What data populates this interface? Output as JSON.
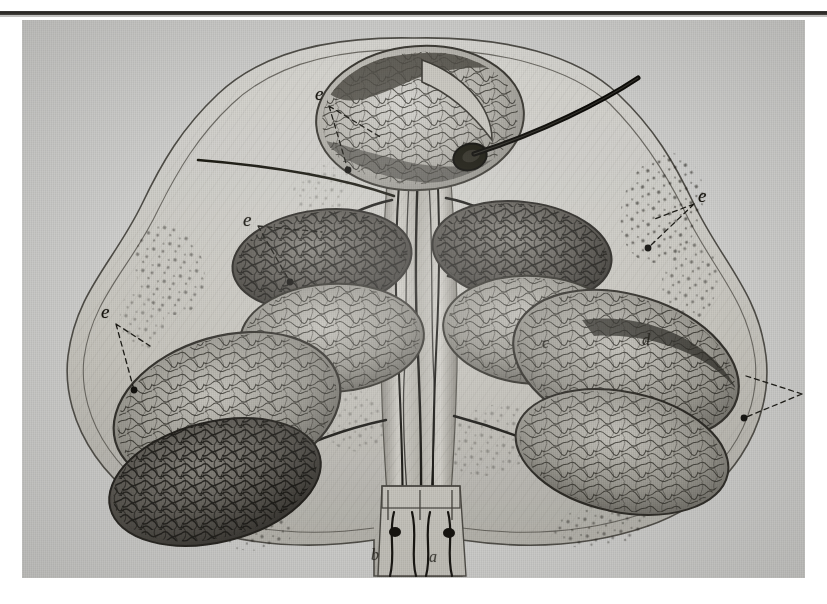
{
  "plate": {
    "title": "Anatomical engraving plate",
    "description": "Cross-section of a lobed glandular organ showing paired symmetric lobules with dense vascular (capillary) networks, a central branching vascular trunk, an outer membranous capsule and a fine probe/bristle inserted into a central aperture.",
    "medium": "steel engraving on laid paper, halftone scan",
    "background_color": "#cfcfcd",
    "ink_color": "#1a1815",
    "rule_color": "#14120f"
  },
  "labels": [
    {
      "id": "label-e-top-left",
      "text": "e",
      "x": 293,
      "y": 74,
      "leader": "dashed"
    },
    {
      "id": "label-e-mid-left",
      "text": "e",
      "x": 221,
      "y": 200,
      "leader": "dashed"
    },
    {
      "id": "label-e-far-left",
      "text": "e",
      "x": 79,
      "y": 292,
      "leader": "dashed"
    },
    {
      "id": "label-e-right",
      "text": "e",
      "x": 676,
      "y": 176,
      "leader": "dashed"
    },
    {
      "id": "label-e-far-right",
      "text": "e",
      "x": 784,
      "y": 366,
      "leader": "dashed"
    },
    {
      "id": "label-d-center-right",
      "text": "d",
      "x": 620,
      "y": 322,
      "leader": "none"
    },
    {
      "id": "label-c-center-right",
      "text": "c",
      "x": 520,
      "y": 325,
      "leader": "none"
    },
    {
      "id": "label-b-bottom-left",
      "text": "b",
      "x": 372,
      "y": 560,
      "leader": "none"
    },
    {
      "id": "label-a-bottom-right",
      "text": "a",
      "x": 430,
      "y": 562,
      "leader": "none"
    }
  ],
  "features": {
    "lobule_count": 8,
    "central_trunk": "central vascular trunk",
    "probe": "inserted bristle / probe",
    "capsule": "outer membranous capsule outline",
    "stipple_regions": "granular stippled connective tissue"
  }
}
